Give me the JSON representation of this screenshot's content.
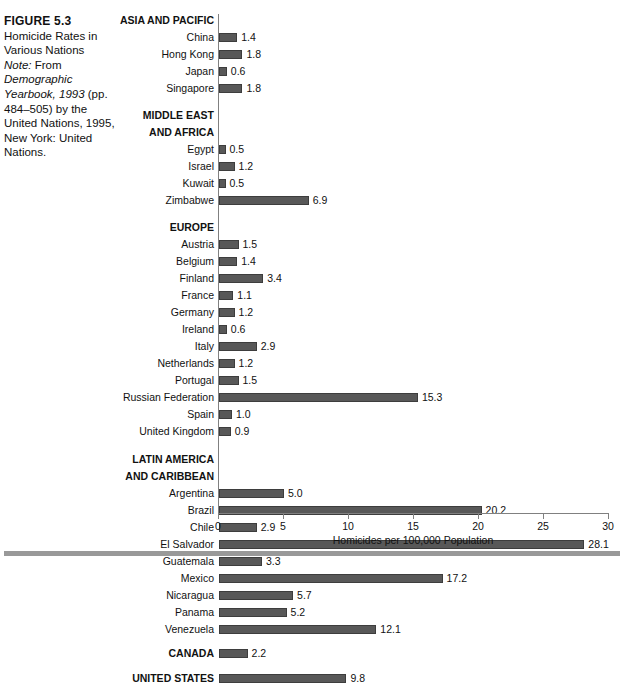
{
  "caption": {
    "figure_number": "FIGURE 5.3",
    "title": "Homicide Rates in Various Nations",
    "note_label": "Note:",
    "note_rest": " From ",
    "source_italic": "Demographic Yearbook, 1993",
    "source_rest": " (pp. 484–505) by the United Nations, 1995, New York: United Nations."
  },
  "chart_data": {
    "type": "bar",
    "orientation": "horizontal",
    "title": "Homicide Rates in Various Nations",
    "xlabel": "Homicides per 100,000 Population",
    "ylabel": "",
    "xlim": [
      0,
      30
    ],
    "xticks": [
      0,
      5,
      10,
      15,
      20,
      25,
      30
    ],
    "xticklabels": [
      "0",
      "5",
      "10",
      "15",
      "20",
      "25",
      "30"
    ],
    "grid": false,
    "legend": null,
    "bar_color": "#585858",
    "groups": [
      {
        "name": "ASIA AND PACIFIC",
        "rows": [
          {
            "label": "China",
            "value": 1.4
          },
          {
            "label": "Hong Kong",
            "value": 1.8
          },
          {
            "label": "Japan",
            "value": 0.6
          },
          {
            "label": "Singapore",
            "value": 1.8
          }
        ]
      },
      {
        "name": "MIDDLE EAST AND AFRICA",
        "name_lines": [
          "MIDDLE EAST",
          "AND AFRICA"
        ],
        "rows": [
          {
            "label": "Egypt",
            "value": 0.5
          },
          {
            "label": "Israel",
            "value": 1.2
          },
          {
            "label": "Kuwait",
            "value": 0.5
          },
          {
            "label": "Zimbabwe",
            "value": 6.9
          }
        ]
      },
      {
        "name": "EUROPE",
        "rows": [
          {
            "label": "Austria",
            "value": 1.5
          },
          {
            "label": "Belgium",
            "value": 1.4
          },
          {
            "label": "Finland",
            "value": 3.4
          },
          {
            "label": "France",
            "value": 1.1
          },
          {
            "label": "Germany",
            "value": 1.2
          },
          {
            "label": "Ireland",
            "value": 0.6
          },
          {
            "label": "Italy",
            "value": 2.9
          },
          {
            "label": "Netherlands",
            "value": 1.2
          },
          {
            "label": "Portugal",
            "value": 1.5
          },
          {
            "label": "Russian Federation",
            "value": 15.3
          },
          {
            "label": "Spain",
            "value": 1.0
          },
          {
            "label": "United Kingdom",
            "value": 0.9
          }
        ]
      },
      {
        "name": "LATIN AMERICA AND CARIBBEAN",
        "name_lines": [
          "LATIN AMERICA",
          "AND CARIBBEAN"
        ],
        "rows": [
          {
            "label": "Argentina",
            "value": 5.0
          },
          {
            "label": "Brazil",
            "value": 20.2
          },
          {
            "label": "Chile",
            "value": 2.9
          },
          {
            "label": "El Salvador",
            "value": 28.1
          },
          {
            "label": "Guatemala",
            "value": 3.3
          },
          {
            "label": "Mexico",
            "value": 17.2
          },
          {
            "label": "Nicaragua",
            "value": 5.7
          },
          {
            "label": "Panama",
            "value": 5.2
          },
          {
            "label": "Venezuela",
            "value": 12.1
          }
        ]
      },
      {
        "name": "",
        "emphasis": true,
        "rows": [
          {
            "label": "CANADA",
            "value": 2.2
          }
        ]
      },
      {
        "name": "",
        "emphasis": true,
        "rows": [
          {
            "label": "UNITED STATES",
            "value": 9.8
          }
        ]
      }
    ]
  }
}
